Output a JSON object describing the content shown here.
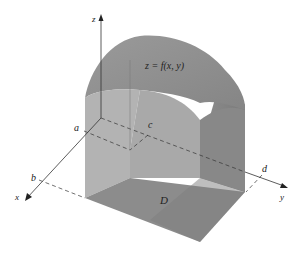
{
  "figure": {
    "surface_label": "z = f(x, y)",
    "region_label": "D",
    "axes": {
      "x": "x",
      "y": "y",
      "z": "z"
    },
    "bounds": {
      "a": "a",
      "b": "b",
      "c": "c",
      "d": "d"
    }
  },
  "colors": {
    "surface_top": "#8f8f8f",
    "side_light": "#b4b4b4",
    "side_mid": "#a2a2a2",
    "side_dark": "#7c7c7c",
    "base": "#8a8a8a",
    "axis": "#333333"
  }
}
